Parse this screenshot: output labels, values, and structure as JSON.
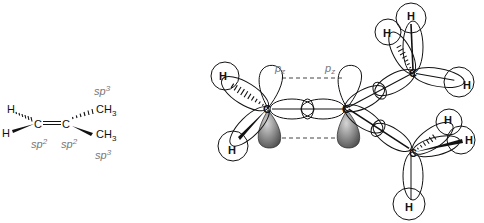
{
  "figure": {
    "structural_formula": {
      "atoms": {
        "h_top": "H",
        "h_bottom": "H",
        "c_left": "C",
        "c_right": "C",
        "ch3_top": "CH",
        "ch3_top_sub": "3",
        "ch3_bottom": "CH",
        "ch3_bottom_sub": "3"
      },
      "hybridization": {
        "c_left": "sp",
        "c_left_sup": "2",
        "c_right": "sp",
        "c_right_sup": "2",
        "ch3_top": "sp",
        "ch3_top_sup": "3",
        "ch3_bottom": "sp",
        "ch3_bottom_sup": "3"
      }
    },
    "orbital_model": {
      "pz_left": "p",
      "pz_left_sub": "z",
      "pz_right": "p",
      "pz_right_sub": "z",
      "carbons": {
        "c1": "C",
        "c2": "C",
        "c3": "C",
        "c4": "C"
      },
      "hydrogens": {
        "h_c1_top": "H",
        "h_c1_bottom": "H",
        "h_c3_a": "H",
        "h_c3_b": "H",
        "h_c3_c": "H",
        "h_c4_a": "H",
        "h_c4_b": "H",
        "h_c4_c": "H"
      },
      "colors": {
        "lobe_shaded": "#6e6e6e",
        "outline": "#111111"
      }
    }
  }
}
